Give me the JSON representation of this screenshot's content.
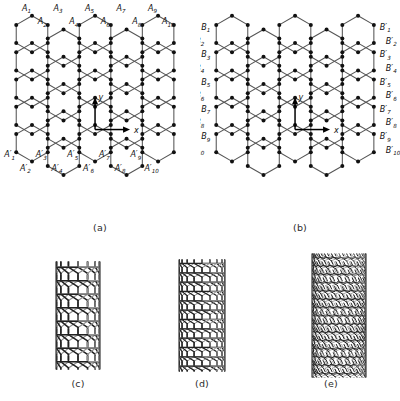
{
  "figure": {
    "background": "#ffffff",
    "line_color": "#4d4d4d",
    "node_color": "#111111",
    "axis_color": "#000000"
  },
  "panels": [
    {
      "id": "a",
      "caption": "(a)",
      "type": "honeycomb-lattice",
      "axes": {
        "x_label": "x",
        "y_label": "y"
      },
      "edge_labeled": "horizontal",
      "top_labels": [
        "A1",
        "A2",
        "A3",
        "A4",
        "A5",
        "A6",
        "A7",
        "A8",
        "A9",
        "A10"
      ],
      "bottom_labels": [
        "A'1",
        "A'2",
        "A'3",
        "A'4",
        "A'5",
        "A'6",
        "A'7",
        "A'8",
        "A'9",
        "A'10"
      ],
      "label_base_top": "A",
      "label_base_bottom": "A",
      "prime_bottom": true,
      "count": 10
    },
    {
      "id": "b",
      "caption": "(b)",
      "type": "honeycomb-lattice",
      "axes": {
        "x_label": "x",
        "y_label": "y"
      },
      "edge_labeled": "vertical",
      "left_labels": [
        "B1",
        "B2",
        "B3",
        "B4",
        "B5",
        "B6",
        "B7",
        "B8",
        "B9",
        "B10"
      ],
      "right_labels": [
        "B'1",
        "B'2",
        "B'3",
        "B'4",
        "B'5",
        "B'6",
        "B'7",
        "B'8",
        "B'9",
        "B'10"
      ],
      "label_base_left": "B",
      "label_base_right": "B",
      "prime_right": true,
      "count": 10
    },
    {
      "id": "c",
      "caption": "(c)",
      "type": "nanotube",
      "chirality": "zigzag",
      "mesh_density": "coarse",
      "tilt_deg": 0,
      "rings_around": 7,
      "rows": 8
    },
    {
      "id": "d",
      "caption": "(d)",
      "type": "nanotube",
      "chirality": "armchair",
      "mesh_density": "medium",
      "tilt_deg": 0,
      "rings_around": 9,
      "rows": 12
    },
    {
      "id": "e",
      "caption": "(e)",
      "type": "nanotube",
      "chirality": "chiral",
      "mesh_density": "fine",
      "tilt_deg": 18,
      "rings_around": 11,
      "rows": 15
    }
  ],
  "lattice_geometry": {
    "columns": 5,
    "rows": 5,
    "orientation": "pointy-top",
    "bond_color": "#555555",
    "vertex_radius": 2.0
  }
}
